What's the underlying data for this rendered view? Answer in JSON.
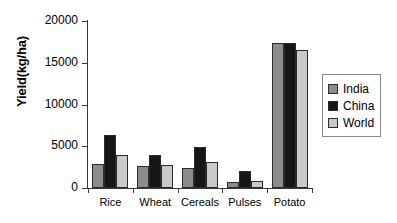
{
  "chart_data": {
    "type": "bar",
    "title": "",
    "xlabel": "",
    "ylabel": "Yield(kg/ha)",
    "categories": [
      "Rice",
      "Wheat",
      "Cereals",
      "Pulses",
      "Potato"
    ],
    "series": [
      {
        "name": "India",
        "color": "#8c8c8c",
        "values": [
          2900,
          2650,
          2400,
          700,
          17400
        ]
      },
      {
        "name": "China",
        "color": "#161616",
        "values": [
          6300,
          4000,
          4900,
          2000,
          17400
        ]
      },
      {
        "name": "World",
        "color": "#c9c9c9",
        "values": [
          3900,
          2800,
          3150,
          900,
          16500
        ]
      }
    ],
    "ylim": [
      0,
      20000
    ],
    "yticks": [
      0,
      5000,
      10000,
      15000,
      20000
    ],
    "ytick_labels": [
      "0",
      "5000",
      "10000",
      "15000",
      "20000"
    ],
    "grid": false,
    "legend_position": "right"
  },
  "legend": {
    "items": [
      {
        "label": "India",
        "swatch": "india-swatch"
      },
      {
        "label": "China",
        "swatch": "china-swatch"
      },
      {
        "label": "World",
        "swatch": "world-swatch"
      }
    ]
  }
}
